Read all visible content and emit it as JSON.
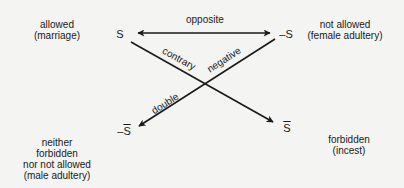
{
  "diagram": {
    "type": "semiotic-square",
    "nodes": {
      "s": {
        "symbol": "S",
        "meaning_line1": "allowed",
        "meaning_line2": "(marriage)"
      },
      "not_s": {
        "symbol": "–S",
        "meaning_line1": "not allowed",
        "meaning_line2": "(female adultery)"
      },
      "s_bar": {
        "symbol": "S",
        "meaning_line1": "forbidden",
        "meaning_line2": "(incest)"
      },
      "not_s_bar": {
        "prefix": "–",
        "symbol": "S",
        "meaning_line1": "neither",
        "meaning_line2": "forbidden",
        "meaning_line3": "nor not allowed",
        "meaning_line4": "(male adultery)"
      }
    },
    "edges": {
      "opposite": {
        "label": "opposite",
        "from": "s",
        "to": "not_s",
        "style": "double-arrow"
      },
      "contrary": {
        "label": "contrary",
        "from": "s",
        "to": "s_bar",
        "style": "arrow"
      },
      "negative": {
        "label": "negative",
        "from": "not_s",
        "to": "not_s_bar",
        "style": "arrow"
      },
      "double": {
        "label": "double",
        "from": "not_s",
        "to": "not_s_bar",
        "style": "arrow"
      }
    },
    "colors": {
      "background": "#f4f4f2",
      "ink": "#1a1a1a"
    }
  }
}
